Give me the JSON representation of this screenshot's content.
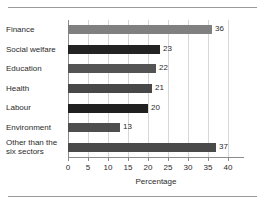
{
  "chart_data": {
    "type": "bar",
    "orientation": "horizontal",
    "title": "",
    "xlabel": "Percentage",
    "ylabel": "",
    "xlim": [
      0,
      44
    ],
    "xticks": [
      0,
      5,
      10,
      15,
      20,
      25,
      30,
      35,
      40
    ],
    "grid": "vertical",
    "legend": "none",
    "categories": [
      "Finance",
      "Social welfare",
      "Education",
      "Health",
      "Labour",
      "Environment",
      "Other than the six sectors"
    ],
    "values": [
      36,
      23,
      22,
      21,
      20,
      13,
      37
    ],
    "bar_colors": [
      "#808080",
      "#232323",
      "#545454",
      "#484848",
      "#202020",
      "#4e4e4e",
      "#4a4a4a"
    ],
    "data_labels": [
      "36",
      "23",
      "22",
      "21",
      "20",
      "13",
      "37"
    ],
    "bars": [
      {
        "label": "Finance",
        "label_lines": [
          "Finance"
        ],
        "value": 36,
        "value_label": "36",
        "color": "#808080"
      },
      {
        "label": "Social welfare",
        "label_lines": [
          "Social welfare"
        ],
        "value": 23,
        "value_label": "23",
        "color": "#232323"
      },
      {
        "label": "Education",
        "label_lines": [
          "Education"
        ],
        "value": 22,
        "value_label": "22",
        "color": "#545454"
      },
      {
        "label": "Health",
        "label_lines": [
          "Health"
        ],
        "value": 21,
        "value_label": "21",
        "color": "#484848"
      },
      {
        "label": "Labour",
        "label_lines": [
          "Labour"
        ],
        "value": 20,
        "value_label": "20",
        "color": "#202020"
      },
      {
        "label": "Environment",
        "label_lines": [
          "Environment"
        ],
        "value": 13,
        "value_label": "13",
        "color": "#4e4e4e"
      },
      {
        "label": "Other than the six sectors",
        "label_lines": [
          "Other than the",
          "six sectors"
        ],
        "value": 37,
        "value_label": "37",
        "color": "#4a4a4a"
      }
    ]
  },
  "axis": {
    "tick_labels": [
      "0",
      "5",
      "10",
      "15",
      "20",
      "25",
      "30",
      "35",
      "40"
    ],
    "title": "Percentage"
  },
  "colors": {
    "background": "#ffffff",
    "axis_line": "#8c8c8c",
    "gridline": "#d7d7d7",
    "rule": "#9a9a9a",
    "text": "#2b2b2b"
  }
}
